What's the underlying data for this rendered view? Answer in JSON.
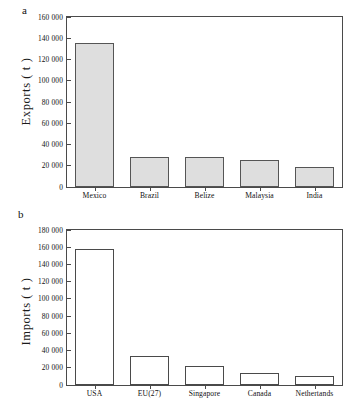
{
  "figure": {
    "panel_a_letter": "a",
    "panel_b_letter": "b"
  },
  "chart_data": [
    {
      "type": "bar",
      "panel": "a",
      "title": "",
      "xlabel": "",
      "ylabel": "Exports ( t )",
      "categories": [
        "Mexico",
        "Brazil",
        "Belize",
        "Malaysia",
        "India"
      ],
      "values": [
        136000,
        28500,
        28000,
        25000,
        19000
      ],
      "ylim": [
        0,
        160000
      ],
      "yticks": [
        0,
        20000,
        40000,
        60000,
        80000,
        100000,
        120000,
        140000,
        160000
      ],
      "ytick_labels": [
        "0",
        "20 000",
        "40 000",
        "60 000",
        "80 000",
        "100 000",
        "120 000",
        "140 000",
        "160 000"
      ],
      "grid": false,
      "legend": null,
      "bar_fill": "#dedede",
      "bar_edge": "#555555"
    },
    {
      "type": "bar",
      "panel": "b",
      "title": "",
      "xlabel": "",
      "ylabel": "Imports ( t )",
      "categories": [
        "USA",
        "EU(27)",
        "Singapore",
        "Canada",
        "Nethertands"
      ],
      "values": [
        158000,
        34000,
        22500,
        14000,
        11000
      ],
      "ylim": [
        0,
        180000
      ],
      "yticks": [
        0,
        20000,
        40000,
        60000,
        80000,
        100000,
        120000,
        140000,
        160000,
        180000
      ],
      "ytick_labels": [
        "0",
        "20 000",
        "40 000",
        "60 000",
        "80 000",
        "100 000",
        "120 000",
        "140 000",
        "160 000",
        "180 000"
      ],
      "grid": false,
      "legend": null,
      "bar_fill": "#ffffff",
      "bar_edge": "#4a4a4a"
    }
  ]
}
